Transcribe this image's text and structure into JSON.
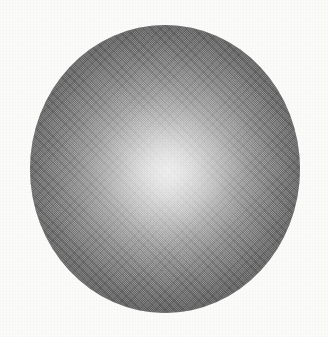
{
  "figure": {
    "kind": "scanned-halftone-illustration",
    "canvas": {
      "width_px": 328,
      "height_px": 337,
      "background_color": "#fbfbfa"
    },
    "sphere": {
      "name": "shaded-sphere",
      "bounds_px": {
        "left": 30,
        "top": 25,
        "width": 270,
        "height": 288
      },
      "shape": "ellipse",
      "shading_model": "radial-gradient",
      "highlight": {
        "center_px": {
          "x": 168,
          "y": 172
        },
        "center_pct": {
          "x": 51,
          "y": 51
        },
        "peak_color": "#efefef"
      },
      "rim_color": "#5b5b5b",
      "midtone_color": "#8a8a8a",
      "terminator_direction": "lower-right",
      "texture": "diagonal halftone crosshatch screen"
    },
    "artifacts": {
      "bleed_through": {
        "name": "bleed-through-smudge",
        "text": "",
        "legible": false,
        "bounds_px": {
          "left": 56,
          "top": 316,
          "width": 200,
          "height": 13
        }
      },
      "paper_grain": true
    }
  }
}
